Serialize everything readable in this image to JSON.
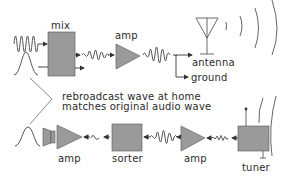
{
  "labels": {
    "mix": "mix",
    "amp_top": "amp",
    "antenna": "antenna",
    "ground": "ground",
    "note_line1": "rebroadcast wave at home",
    "note_line2": "matches original audio wave",
    "amp_bottom_left": "amp",
    "sorter": "sorter",
    "amp_bottom_right": "amp",
    "tuner": "tuner"
  },
  "colors": {
    "block_fill": "#9a9a9a",
    "stroke": "#3a3a3a",
    "background": "#ffffff"
  }
}
